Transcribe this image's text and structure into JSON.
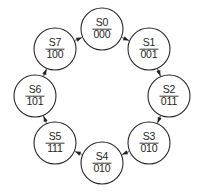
{
  "diagram": {
    "type": "state-machine-ring",
    "direction": "clockwise",
    "background_color": "#ffffff",
    "line_color": "#231f20",
    "node_fill": "#ffffff",
    "geometry": {
      "center_x": 102,
      "center_y": 96,
      "ring_radius": 67,
      "node_radius": 21
    },
    "nodes": [
      {
        "id": "S0",
        "name": "S0",
        "code": "000",
        "cx": 102,
        "cy": 29,
        "angle_deg": -90
      },
      {
        "id": "S1",
        "name": "S1",
        "code": "001",
        "cx": 149,
        "cy": 49,
        "angle_deg": -45
      },
      {
        "id": "S2",
        "name": "S2",
        "code": "011",
        "cx": 169,
        "cy": 96,
        "angle_deg": 0
      },
      {
        "id": "S3",
        "name": "S3",
        "code": "010",
        "cx": 149,
        "cy": 143,
        "angle_deg": 45
      },
      {
        "id": "S4",
        "name": "S4",
        "code": "010",
        "cx": 102,
        "cy": 163,
        "angle_deg": 90
      },
      {
        "id": "S5",
        "name": "S5",
        "code": "111",
        "cx": 55,
        "cy": 143,
        "angle_deg": 135
      },
      {
        "id": "S6",
        "name": "S6",
        "code": "101",
        "cx": 35,
        "cy": 96,
        "angle_deg": 180
      },
      {
        "id": "S7",
        "name": "S7",
        "code": "100",
        "cx": 55,
        "cy": 49,
        "angle_deg": 225
      }
    ],
    "edges": [
      {
        "from": "S0",
        "to": "S1"
      },
      {
        "from": "S1",
        "to": "S2"
      },
      {
        "from": "S2",
        "to": "S3"
      },
      {
        "from": "S3",
        "to": "S4"
      },
      {
        "from": "S4",
        "to": "S5"
      },
      {
        "from": "S5",
        "to": "S6"
      },
      {
        "from": "S6",
        "to": "S7"
      },
      {
        "from": "S7",
        "to": "S0"
      }
    ]
  }
}
